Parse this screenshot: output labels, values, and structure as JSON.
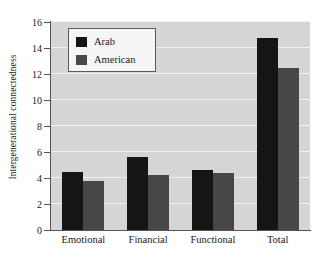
{
  "chart_data": {
    "type": "bar",
    "title": "",
    "xlabel": "",
    "ylabel": "Intergenerational connectedness",
    "categories": [
      "Emotional",
      "Financial",
      "Functional",
      "Total"
    ],
    "series": [
      {
        "name": "Arab",
        "color": "#151515",
        "values": [
          4.5,
          5.6,
          4.6,
          14.8
        ]
      },
      {
        "name": "American",
        "color": "#474747",
        "values": [
          3.8,
          4.2,
          4.4,
          12.5
        ]
      }
    ],
    "ylim": [
      0,
      16
    ],
    "yticks": [
      0,
      2,
      4,
      6,
      8,
      10,
      12,
      14,
      16
    ],
    "ytick_labels": [
      "0",
      "2",
      "4",
      "6",
      "8",
      "10",
      "12",
      "14",
      "16"
    ],
    "grid": true,
    "grid_axis": "y",
    "legend_position": "upper left",
    "plot_background": "#d5d5d5",
    "gridline_color": "#f2f2f2",
    "figure_background": "#ffffff"
  }
}
